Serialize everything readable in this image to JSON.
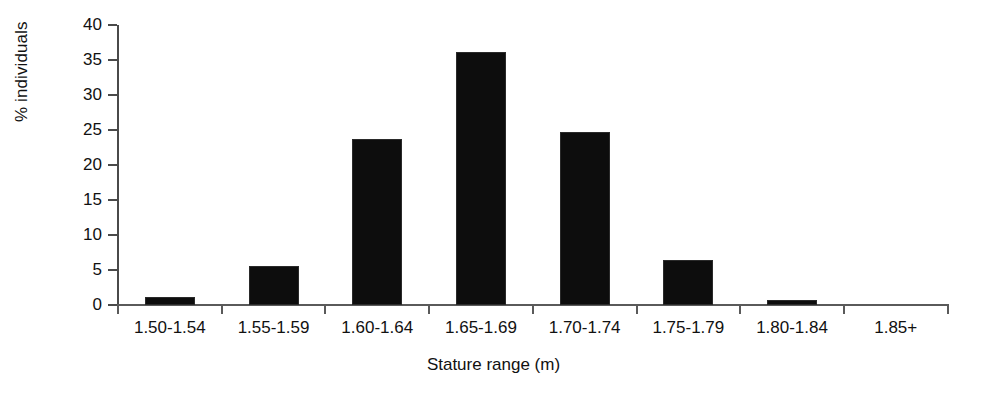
{
  "chart_data": {
    "type": "bar",
    "title": "",
    "xlabel": "Stature range (m)",
    "ylabel": "% individuals",
    "categories": [
      "1.50-1.54",
      "1.55-1.59",
      "1.60-1.64",
      "1.65-1.69",
      "1.70-1.74",
      "1.75-1.79",
      "1.80-1.84",
      "1.85+"
    ],
    "values": [
      1.2,
      5.6,
      23.7,
      36.2,
      24.7,
      6.5,
      0.7,
      0
    ],
    "ylim": [
      0,
      40
    ],
    "ytick_labels": [
      "0",
      "5",
      "10",
      "15",
      "20",
      "25",
      "30",
      "35",
      "40"
    ],
    "ytick_values": [
      0,
      5,
      10,
      15,
      20,
      25,
      30,
      35,
      40
    ],
    "grid": false,
    "legend": "none",
    "bar_color": "#0d0d0d",
    "axis_color": "#4a4a4a"
  }
}
